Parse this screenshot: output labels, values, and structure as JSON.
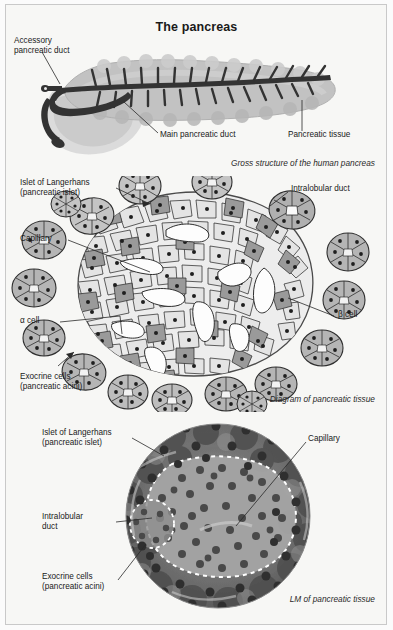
{
  "document": {
    "title": "The pancreas",
    "page_background": "#f7f7f5",
    "ink_color": "#1a1a1a"
  },
  "panels": [
    {
      "id": "gross-anatomy",
      "caption": "Gross structure of the human pancreas",
      "labels": [
        {
          "id": "accessory-pancreatic-duct",
          "text": "Accessory\npancreatic duct"
        },
        {
          "id": "main-pancreatic-duct",
          "text": "Main pancreatic duct"
        },
        {
          "id": "pancreatic-tissue",
          "text": "Pancreatic tissue"
        }
      ],
      "colors": {
        "tissue_fill": "#b9b9b9",
        "tissue_shadow": "#cfcfcf",
        "duct_fill": "#3c3c3c",
        "duodenum_fill": "#c6c6c6"
      }
    },
    {
      "id": "diagram-pancreatic-tissue",
      "caption": "Diagram of pancreatic tissue",
      "labels": [
        {
          "id": "islet-of-langerhans",
          "text": "Islet of Langerhans\n(pancreatic islet)"
        },
        {
          "id": "capillary",
          "text": "Capillary"
        },
        {
          "id": "alpha-cell",
          "text": "α cell"
        },
        {
          "id": "exocrine-cells",
          "text": "Exocrine cells\n(pancreatic acini)"
        },
        {
          "id": "intralobular-duct",
          "text": "Intralobular duct"
        },
        {
          "id": "beta-cell",
          "text": "β cell"
        }
      ],
      "colors": {
        "beta_cell_fill": "#e8e8e8",
        "alpha_cell_fill": "#9a9a9a",
        "acinus_fill": "#bdbdbd",
        "acinus_light": "#efefef",
        "capillary_fill": "#fbfbfb",
        "outline": "#2e2e2e",
        "islet_border": "#4a4a4a"
      },
      "counts": {
        "acini_around_islet": 17,
        "capillary_lumens": 9
      }
    },
    {
      "id": "light-micrograph",
      "caption": "LM of pancreatic tissue",
      "labels": [
        {
          "id": "islet-of-langerhans",
          "text": "Islet of Langerhans\n(pancreatic islet)"
        },
        {
          "id": "intralobular-duct",
          "text": "Intralobular\nduct"
        },
        {
          "id": "exocrine-cells",
          "text": "Exocrine cells\n(pancreatic acini)"
        },
        {
          "id": "capillary",
          "text": "Capillary"
        }
      ],
      "colors": {
        "field_dark": "#595959",
        "field_mid": "#7a7a7a",
        "islet_fill": "#9e9e9e",
        "nuclei": "#3a3a3a",
        "dashed_outline": "#ffffff"
      }
    }
  ]
}
